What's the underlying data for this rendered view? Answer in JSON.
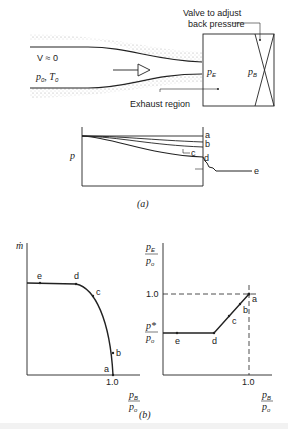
{
  "figure_a": {
    "valve_label_line1": "Valve to adjust",
    "valve_label_line2": "back pressure",
    "velocity_label": "V ≈ 0",
    "stagnation_p": "p",
    "stagnation_p_sub": "0",
    "stagnation_T": "T",
    "stagnation_T_sub": "0",
    "exit_pressure": "p",
    "exit_pressure_sub": "E",
    "back_pressure": "p",
    "back_pressure_sub": "B",
    "exhaust_label": "Exhaust region",
    "pressure_axis_label": "p",
    "curve_labels": [
      "a",
      "b",
      "c",
      "d",
      "e"
    ],
    "caption": "(a)"
  },
  "figure_b": {
    "caption": "(b)",
    "left_plot": {
      "ylabel": "ṁ",
      "xtick": "1.0",
      "xlabel_num": "p",
      "xlabel_num_sub": "B",
      "xlabel_den": "p",
      "xlabel_den_sub": "o",
      "point_labels": [
        "e",
        "d",
        "c",
        "b",
        "a"
      ]
    },
    "right_plot": {
      "ylabel_num": "p",
      "ylabel_num_sub": "E",
      "ylabel_den": "p",
      "ylabel_den_sub": "o",
      "ytick_top": "1.0",
      "ytick_pstar_num": "p*",
      "ytick_pstar_den": "p",
      "ytick_pstar_den_sub": "o",
      "xtick": "1.0",
      "xlabel_num": "p",
      "xlabel_num_sub": "B",
      "xlabel_den": "p",
      "xlabel_den_sub": "o",
      "point_labels": [
        "e",
        "d",
        "c",
        "b",
        "a"
      ]
    }
  }
}
